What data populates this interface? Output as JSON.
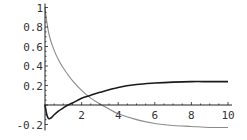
{
  "chart_data": {
    "type": "line",
    "title": "",
    "xlabel": "",
    "ylabel": "",
    "xlim": [
      0,
      10
    ],
    "ylim": [
      -0.2,
      1
    ],
    "grid": false,
    "legend": null,
    "x_ticks": [
      2,
      4,
      6,
      8,
      10
    ],
    "x_tick_labels": [
      "2",
      "4",
      "6",
      "8",
      "10"
    ],
    "y_ticks": [
      -0.2,
      0.2,
      0.4,
      0.6,
      0.8,
      1
    ],
    "y_tick_labels": [
      "-0.2",
      "0.2",
      "0.4",
      "0.6",
      "0.8",
      "1"
    ],
    "series": [
      {
        "name": "gray-decaying-curve",
        "color": "#8a8a8a",
        "x": [
          0,
          0.1,
          0.25,
          0.5,
          0.75,
          1,
          1.5,
          2,
          2.5,
          3,
          3.5,
          4,
          5,
          6,
          7,
          8,
          9,
          10
        ],
        "y": [
          1.0,
          0.85,
          0.7,
          0.56,
          0.46,
          0.38,
          0.25,
          0.15,
          0.07,
          0.01,
          -0.04,
          -0.09,
          -0.15,
          -0.19,
          -0.21,
          -0.22,
          -0.23,
          -0.23
        ]
      },
      {
        "name": "dark-rising-curve",
        "color": "#1a1a1a",
        "x": [
          0,
          0.1,
          0.2,
          0.35,
          0.5,
          0.75,
          1,
          1.25,
          1.5,
          2,
          2.5,
          3,
          4,
          5,
          6,
          7,
          8,
          9,
          10
        ],
        "y": [
          0.0,
          -0.1,
          -0.14,
          -0.13,
          -0.1,
          -0.06,
          -0.03,
          0.0,
          0.02,
          0.07,
          0.1,
          0.13,
          0.18,
          0.21,
          0.225,
          0.235,
          0.24,
          0.24,
          0.24
        ]
      }
    ]
  }
}
